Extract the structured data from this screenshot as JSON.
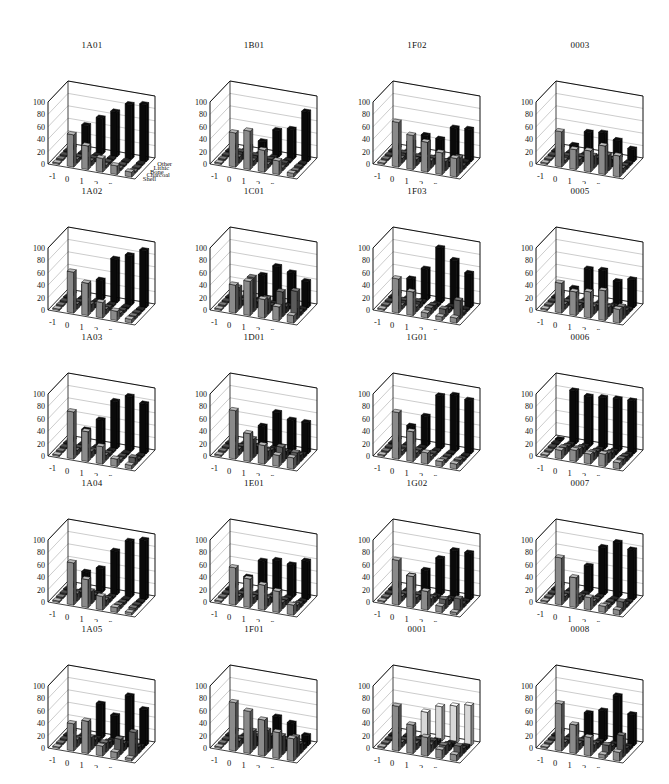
{
  "figure": {
    "rows": 5,
    "cols": 4
  },
  "chart_data": {
    "type": "bar3d",
    "categories": [
      "-1",
      "0",
      "1",
      "2",
      "3",
      "4"
    ],
    "series_names": [
      "Shell",
      "Charcoal",
      "Bone",
      "Lithic",
      "Other"
    ],
    "ylim": [
      0,
      100
    ],
    "yticks": [
      0,
      20,
      40,
      60,
      80,
      100
    ],
    "colors": {
      "Shell": "#8a8a8a",
      "Charcoal": "#5a5a5a",
      "Bone": "#3a3a3a",
      "Lithic": "#1e1e1e",
      "Other": "#0a0a0a",
      "Other_0001": "#d8d8d8"
    },
    "panels": [
      {
        "title": "1A01",
        "show_legend": true,
        "series": {
          "Shell": [
            0,
            52,
            38,
            22,
            14,
            8
          ],
          "Charcoal": [
            0,
            6,
            8,
            5,
            4,
            3
          ],
          "Bone": [
            0,
            4,
            6,
            4,
            3,
            2
          ],
          "Lithic": [
            0,
            3,
            4,
            3,
            2,
            2
          ],
          "Other": [
            0,
            42,
            58,
            72,
            88,
            92
          ]
        }
      },
      {
        "title": "1B01",
        "series": {
          "Shell": [
            0,
            55,
            62,
            35,
            22,
            6
          ],
          "Charcoal": [
            0,
            10,
            8,
            6,
            5,
            4
          ],
          "Bone": [
            0,
            12,
            10,
            8,
            6,
            4
          ],
          "Lithic": [
            0,
            6,
            5,
            5,
            4,
            3
          ],
          "Other": [
            0,
            8,
            20,
            42,
            48,
            80
          ]
        }
      },
      {
        "title": "1F02",
        "series": {
          "Shell": [
            0,
            72,
            55,
            48,
            35,
            30
          ],
          "Charcoal": [
            0,
            8,
            10,
            12,
            15,
            25
          ],
          "Bone": [
            0,
            10,
            8,
            10,
            8,
            6
          ],
          "Lithic": [
            0,
            5,
            4,
            4,
            5,
            6
          ],
          "Other": [
            0,
            15,
            30,
            28,
            50,
            52
          ]
        }
      },
      {
        "title": "0003",
        "series": {
          "Shell": [
            0,
            57,
            32,
            34,
            46,
            34
          ],
          "Charcoal": [
            0,
            5,
            10,
            20,
            25,
            8
          ],
          "Bone": [
            0,
            6,
            8,
            10,
            12,
            6
          ],
          "Lithic": [
            0,
            4,
            5,
            5,
            6,
            4
          ],
          "Other": [
            0,
            10,
            35,
            38,
            30,
            20
          ]
        }
      },
      {
        "title": "1A02",
        "series": {
          "Shell": [
            0,
            66,
            52,
            25,
            15,
            6
          ],
          "Charcoal": [
            0,
            8,
            12,
            8,
            6,
            5
          ],
          "Bone": [
            0,
            6,
            6,
            5,
            4,
            4
          ],
          "Lithic": [
            0,
            4,
            4,
            3,
            3,
            3
          ],
          "Other": [
            0,
            20,
            32,
            70,
            80,
            92
          ]
        }
      },
      {
        "title": "1C01",
        "series": {
          "Shell": [
            0,
            45,
            55,
            30,
            22,
            12
          ],
          "Charcoal": [
            0,
            35,
            55,
            25,
            40,
            45
          ],
          "Bone": [
            0,
            8,
            10,
            8,
            10,
            6
          ],
          "Lithic": [
            0,
            5,
            6,
            5,
            5,
            4
          ],
          "Other": [
            0,
            10,
            40,
            58,
            52,
            42
          ]
        }
      },
      {
        "title": "1F03",
        "series": {
          "Shell": [
            0,
            55,
            38,
            8,
            6,
            8
          ],
          "Charcoal": [
            0,
            6,
            8,
            10,
            12,
            30
          ],
          "Bone": [
            0,
            8,
            10,
            8,
            6,
            5
          ],
          "Lithic": [
            0,
            4,
            4,
            4,
            4,
            4
          ],
          "Other": [
            0,
            30,
            50,
            88,
            72,
            55
          ]
        }
      },
      {
        "title": "0005",
        "series": {
          "Shell": [
            0,
            48,
            38,
            42,
            48,
            22
          ],
          "Charcoal": [
            0,
            8,
            10,
            12,
            15,
            20
          ],
          "Bone": [
            0,
            6,
            8,
            8,
            10,
            8
          ],
          "Lithic": [
            0,
            4,
            5,
            5,
            5,
            4
          ],
          "Other": [
            0,
            15,
            50,
            52,
            38,
            45
          ]
        }
      },
      {
        "title": "1A03",
        "series": {
          "Shell": [
            0,
            76,
            48,
            28,
            12,
            6
          ],
          "Charcoal": [
            0,
            8,
            10,
            8,
            5,
            12
          ],
          "Bone": [
            0,
            6,
            6,
            5,
            4,
            4
          ],
          "Lithic": [
            0,
            4,
            4,
            3,
            3,
            3
          ],
          "Other": [
            0,
            22,
            42,
            76,
            88,
            80
          ]
        }
      },
      {
        "title": "1D01",
        "series": {
          "Shell": [
            0,
            78,
            45,
            30,
            18,
            18
          ],
          "Charcoal": [
            0,
            10,
            30,
            15,
            25,
            20
          ],
          "Bone": [
            0,
            8,
            12,
            10,
            12,
            10
          ],
          "Lithic": [
            0,
            5,
            6,
            6,
            5,
            5
          ],
          "Other": [
            0,
            15,
            32,
            58,
            50,
            50
          ]
        }
      },
      {
        "title": "1G01",
        "series": {
          "Shell": [
            0,
            75,
            48,
            18,
            8,
            8
          ],
          "Charcoal": [
            0,
            6,
            8,
            6,
            5,
            8
          ],
          "Bone": [
            0,
            6,
            6,
            5,
            4,
            4
          ],
          "Lithic": [
            0,
            4,
            4,
            3,
            3,
            3
          ],
          "Other": [
            0,
            28,
            48,
            85,
            90,
            86
          ]
        }
      },
      {
        "title": "0006",
        "series": {
          "Shell": [
            0,
            14,
            18,
            16,
            20,
            10
          ],
          "Charcoal": [
            0,
            12,
            14,
            12,
            15,
            10
          ],
          "Bone": [
            0,
            8,
            10,
            8,
            10,
            8
          ],
          "Lithic": [
            0,
            5,
            6,
            5,
            6,
            5
          ],
          "Other": [
            0,
            85,
            80,
            82,
            84,
            85
          ]
        }
      },
      {
        "title": "1A04",
        "series": {
          "Shell": [
            0,
            68,
            45,
            22,
            8,
            4
          ],
          "Charcoal": [
            0,
            12,
            20,
            10,
            6,
            5
          ],
          "Bone": [
            0,
            8,
            8,
            6,
            4,
            4
          ],
          "Lithic": [
            0,
            4,
            4,
            3,
            3,
            3
          ],
          "Other": [
            0,
            28,
            38,
            70,
            90,
            96
          ]
        }
      },
      {
        "title": "1E01",
        "series": {
          "Shell": [
            0,
            60,
            46,
            40,
            34,
            16
          ],
          "Charcoal": [
            0,
            8,
            10,
            12,
            10,
            10
          ],
          "Bone": [
            0,
            6,
            8,
            8,
            8,
            6
          ],
          "Lithic": [
            0,
            4,
            5,
            5,
            5,
            4
          ],
          "Other": [
            0,
            20,
            50,
            55,
            52,
            62
          ]
        }
      },
      {
        "title": "1G02",
        "series": {
          "Shell": [
            0,
            72,
            50,
            30,
            10,
            4
          ],
          "Charcoal": [
            0,
            8,
            10,
            12,
            15,
            20
          ],
          "Bone": [
            0,
            6,
            8,
            8,
            8,
            6
          ],
          "Lithic": [
            0,
            4,
            4,
            4,
            4,
            4
          ],
          "Other": [
            0,
            22,
            35,
            58,
            75,
            75
          ]
        }
      },
      {
        "title": "0007",
        "series": {
          "Shell": [
            0,
            76,
            48,
            20,
            10,
            8
          ],
          "Charcoal": [
            0,
            8,
            10,
            8,
            6,
            15
          ],
          "Bone": [
            0,
            6,
            6,
            5,
            5,
            5
          ],
          "Lithic": [
            0,
            4,
            4,
            3,
            3,
            3
          ],
          "Other": [
            0,
            18,
            42,
            76,
            88,
            80
          ]
        }
      },
      {
        "title": "1A05",
        "series": {
          "Shell": [
            0,
            44,
            52,
            16,
            10,
            4
          ],
          "Charcoal": [
            0,
            12,
            20,
            15,
            25,
            40
          ],
          "Bone": [
            0,
            8,
            10,
            10,
            12,
            10
          ],
          "Lithic": [
            0,
            5,
            6,
            6,
            6,
            5
          ],
          "Other": [
            0,
            20,
            55,
            40,
            76,
            58
          ]
        }
      },
      {
        "title": "1F01",
        "series": {
          "Shell": [
            0,
            78,
            68,
            58,
            42,
            36
          ],
          "Charcoal": [
            0,
            10,
            30,
            35,
            30,
            32
          ],
          "Bone": [
            0,
            8,
            15,
            20,
            18,
            15
          ],
          "Lithic": [
            0,
            5,
            8,
            10,
            8,
            8
          ],
          "Other": [
            0,
            2,
            28,
            38,
            32,
            16
          ]
        }
      },
      {
        "title": "0001",
        "other_color_light": true,
        "series": {
          "Shell": [
            0,
            72,
            46,
            30,
            14,
            10
          ],
          "Charcoal": [
            0,
            8,
            10,
            12,
            15,
            18
          ],
          "Bone": [
            0,
            6,
            10,
            12,
            10,
            8
          ],
          "Lithic": [
            0,
            5,
            6,
            6,
            6,
            5
          ],
          "Other": [
            0,
            12,
            42,
            55,
            60,
            65
          ]
        }
      },
      {
        "title": "0008",
        "series": {
          "Shell": [
            0,
            76,
            46,
            30,
            6,
            14
          ],
          "Charcoal": [
            0,
            8,
            10,
            12,
            15,
            35
          ],
          "Bone": [
            0,
            6,
            8,
            8,
            8,
            8
          ],
          "Lithic": [
            0,
            4,
            5,
            5,
            5,
            5
          ],
          "Other": [
            0,
            15,
            40,
            48,
            76,
            50
          ]
        }
      }
    ]
  }
}
